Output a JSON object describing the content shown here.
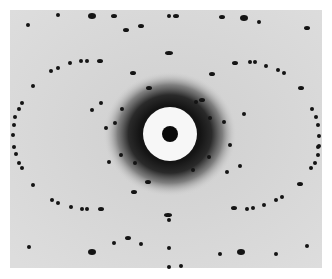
{
  "image": {
    "kind": "diffraction-pattern-photograph",
    "width": 332,
    "height": 279,
    "colors": {
      "border": "#ffffff",
      "field": "#d9d9d9",
      "halo": "#1e1e1e",
      "ring": "#f7f7f7",
      "center": "#0a0a0a",
      "spot": "#141414"
    },
    "field_rect": {
      "x": 10,
      "y": 10,
      "w": 312,
      "h": 258
    },
    "center": {
      "x": 170,
      "y": 134
    },
    "halo_radius": 42,
    "ring_radius": 27,
    "center_radius": 8,
    "spots": [
      [
        58,
        15,
        2,
        2
      ],
      [
        92,
        16,
        4,
        3
      ],
      [
        114,
        16,
        3,
        2
      ],
      [
        126,
        30,
        3,
        2
      ],
      [
        141,
        26,
        3,
        2
      ],
      [
        169,
        16,
        2,
        2
      ],
      [
        169,
        53,
        4,
        2
      ],
      [
        176,
        16,
        3,
        2
      ],
      [
        222,
        17,
        3,
        2
      ],
      [
        244,
        18,
        4,
        3
      ],
      [
        259,
        22,
        2,
        2
      ],
      [
        307,
        28,
        3,
        2
      ],
      [
        28,
        25,
        2,
        2
      ],
      [
        51,
        71,
        2,
        2
      ],
      [
        58,
        68,
        2,
        2
      ],
      [
        70,
        63,
        2,
        2
      ],
      [
        81,
        61,
        2,
        2
      ],
      [
        87,
        61,
        2,
        2
      ],
      [
        100,
        61,
        3,
        2
      ],
      [
        133,
        73,
        3,
        2
      ],
      [
        149,
        88,
        3,
        2
      ],
      [
        235,
        63,
        3,
        2
      ],
      [
        250,
        62,
        2,
        2
      ],
      [
        255,
        62,
        2,
        2
      ],
      [
        266,
        66,
        2,
        2
      ],
      [
        278,
        70,
        2,
        2
      ],
      [
        284,
        73,
        2,
        2
      ],
      [
        301,
        88,
        3,
        2
      ],
      [
        212,
        74,
        3,
        2
      ],
      [
        202,
        100,
        3,
        2
      ],
      [
        33,
        86,
        2,
        2
      ],
      [
        22,
        103,
        2,
        2
      ],
      [
        19,
        109,
        2,
        2
      ],
      [
        15,
        117,
        2,
        2
      ],
      [
        14,
        125,
        2,
        2
      ],
      [
        13,
        135,
        2,
        2
      ],
      [
        312,
        109,
        2,
        2
      ],
      [
        316,
        117,
        2,
        2
      ],
      [
        318,
        125,
        2,
        2
      ],
      [
        319,
        136,
        2,
        2
      ],
      [
        319,
        146,
        2,
        2
      ],
      [
        14,
        147,
        2,
        2
      ],
      [
        16,
        154,
        2,
        2
      ],
      [
        19,
        163,
        2,
        2
      ],
      [
        22,
        168,
        2,
        2
      ],
      [
        33,
        185,
        2,
        2
      ],
      [
        52,
        200,
        2,
        2
      ],
      [
        58,
        203,
        2,
        2
      ],
      [
        71,
        207,
        2,
        2
      ],
      [
        82,
        209,
        2,
        2
      ],
      [
        87,
        209,
        2,
        2
      ],
      [
        101,
        209,
        3,
        2
      ],
      [
        134,
        192,
        3,
        2
      ],
      [
        148,
        182,
        3,
        2
      ],
      [
        168,
        215,
        4,
        2
      ],
      [
        169,
        220,
        2,
        2
      ],
      [
        234,
        208,
        3,
        2
      ],
      [
        247,
        209,
        2,
        2
      ],
      [
        253,
        208,
        2,
        2
      ],
      [
        264,
        205,
        2,
        2
      ],
      [
        276,
        200,
        2,
        2
      ],
      [
        282,
        197,
        2,
        2
      ],
      [
        300,
        184,
        3,
        2
      ],
      [
        318,
        147,
        2,
        2
      ],
      [
        318,
        155,
        2,
        2
      ],
      [
        315,
        163,
        2,
        2
      ],
      [
        311,
        168,
        2,
        2
      ],
      [
        29,
        247,
        2,
        2
      ],
      [
        92,
        252,
        4,
        3
      ],
      [
        114,
        243,
        2,
        2
      ],
      [
        128,
        238,
        3,
        2
      ],
      [
        141,
        244,
        2,
        2
      ],
      [
        169,
        248,
        2,
        2
      ],
      [
        220,
        254,
        2,
        2
      ],
      [
        241,
        252,
        4,
        3
      ],
      [
        276,
        254,
        2,
        2
      ],
      [
        307,
        246,
        2,
        2
      ],
      [
        169,
        267,
        2,
        2
      ],
      [
        181,
        266,
        2,
        2
      ],
      [
        209,
        157,
        2,
        2
      ],
      [
        193,
        170,
        2,
        2
      ],
      [
        122,
        109,
        2,
        2
      ],
      [
        115,
        123,
        2,
        2
      ],
      [
        121,
        155,
        2,
        2
      ],
      [
        135,
        163,
        2,
        2
      ],
      [
        196,
        102,
        2,
        2
      ],
      [
        210,
        118,
        2,
        2
      ],
      [
        224,
        122,
        2,
        2
      ],
      [
        230,
        145,
        2,
        2
      ],
      [
        109,
        162,
        2,
        2
      ],
      [
        106,
        128,
        2,
        2
      ],
      [
        92,
        110,
        2,
        2
      ],
      [
        101,
        103,
        2,
        2
      ],
      [
        240,
        166,
        2,
        2
      ],
      [
        227,
        172,
        2,
        2
      ],
      [
        244,
        114,
        2,
        2
      ]
    ]
  }
}
